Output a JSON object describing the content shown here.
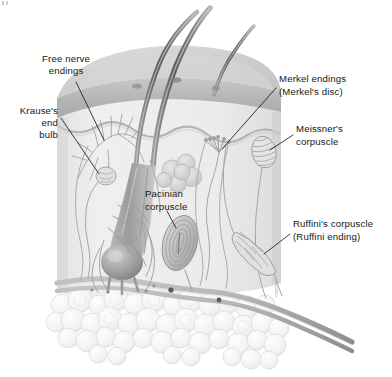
{
  "figure": {
    "background_color": "#ffffff",
    "ink_color": "#161616",
    "leader_color": "#1a1a1a"
  },
  "labels": {
    "free_nerve_endings": {
      "line1": "Free nerve",
      "line2": "endings",
      "align": "center",
      "x": 66,
      "y": 62
    },
    "krauses_end_bulb": {
      "line1": "Krause's",
      "line2": "end",
      "line3": "bulb",
      "align": "right",
      "x": 58,
      "y": 114
    },
    "merkel_endings": {
      "line1": "Merkel endings",
      "line2": "(Merkel's disc)",
      "align": "left",
      "x": 279,
      "y": 82
    },
    "meissners_corpuscle": {
      "line1": "Meissner's",
      "line2": "corpuscle",
      "align": "left",
      "x": 296,
      "y": 132
    },
    "pacinian_corpuscle": {
      "line1": "Pacinian",
      "line2": "corpuscle",
      "align": "left",
      "x": 145,
      "y": 197
    },
    "ruffinis_corpuscle": {
      "line1": "Ruffini's corpuscle",
      "line2": "(Ruffini ending)",
      "align": "left",
      "x": 293,
      "y": 227
    }
  },
  "anatomy": {
    "layers": [
      {
        "name": "epidermis",
        "color": "#b9b9b9"
      },
      {
        "name": "dermis",
        "color": "#eaeaea"
      },
      {
        "name": "subcutaneous-fat",
        "color": "#f2f2f2"
      }
    ],
    "structures": [
      "hair-shaft",
      "hair-shaft",
      "hair-shaft",
      "hair-follicle",
      "hair-bulb",
      "sebaceous-gland",
      "free-nerve-endings",
      "krause-end-bulb",
      "merkel-endings",
      "meissner-corpuscle",
      "pacinian-corpuscle",
      "ruffini-corpuscle",
      "nerve-trunk",
      "fat-lobules"
    ]
  },
  "colors": {
    "hair_dark": "#6d6d6d",
    "hair_mid": "#8f8f8f",
    "nerve": "#a6a6a6",
    "outline": "#8a8a8a",
    "fat_fill": "#f6f6f6",
    "fat_edge": "#d8d8d8"
  }
}
